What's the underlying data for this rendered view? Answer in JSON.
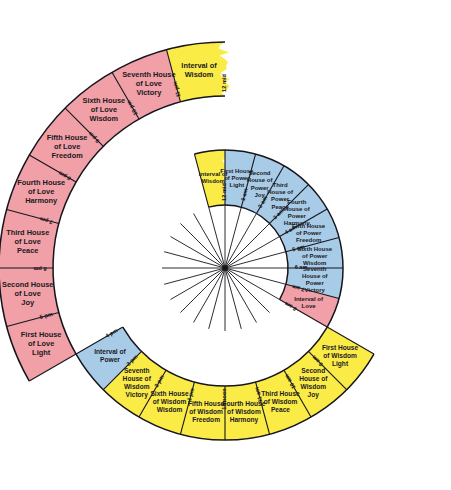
{
  "figure": {
    "name": "spiral-wheel-of-houses",
    "center": {
      "x": 225,
      "y": 268
    },
    "radii": {
      "inner_hole": 63,
      "ring1_outer": 118,
      "ring2_outer": 172,
      "ring3_outer": 226
    },
    "colors": {
      "power_blue": "#A8CBE8",
      "wisdom_yellow": "#FBEB47",
      "love_pink": "#F0A0A6",
      "outline": "#15151c",
      "background": "#ffffff",
      "center_fill": "#ffffff"
    }
  },
  "rings": [
    {
      "name": "inner-ring-power",
      "index": 1,
      "segments": [
        {
          "label": "Interval of\nWisdom",
          "lines": [
            "Interval of",
            "Wisdom"
          ],
          "color": "#FBEB47",
          "start_hour": 23,
          "end_hour": 24,
          "torn": true
        },
        {
          "label": "First House\nof Power\nLight",
          "lines": [
            "First House",
            "of Power",
            "Light"
          ],
          "color": "#A8CBE8",
          "start_hour": 0,
          "end_hour": 1
        },
        {
          "label": "Second\nHouse of\nPower\nJoy",
          "lines": [
            "Second",
            "House of",
            "Power",
            "Joy"
          ],
          "color": "#A8CBE8",
          "start_hour": 1,
          "end_hour": 2
        },
        {
          "label": "Third\nHouse of\nPower\nPeace",
          "lines": [
            "Third",
            "House of",
            "Power",
            "Peace"
          ],
          "color": "#A8CBE8",
          "start_hour": 2,
          "end_hour": 3
        },
        {
          "label": "Fourth\nHouse of\nPower\nHarmony",
          "lines": [
            "Fourth",
            "House of",
            "Power",
            "Harmony"
          ],
          "color": "#A8CBE8",
          "start_hour": 3,
          "end_hour": 4
        },
        {
          "label": "Fifth House\nof Power\nFreedom",
          "lines": [
            "Fifth House",
            "of Power",
            "Freedom"
          ],
          "color": "#A8CBE8",
          "start_hour": 4,
          "end_hour": 5
        },
        {
          "label": "Sixth House\nof Power\nWisdom",
          "lines": [
            "Sixth House",
            "of Power",
            "Wisdom"
          ],
          "color": "#A8CBE8",
          "start_hour": 5,
          "end_hour": 6
        },
        {
          "label": "Seventh\nHouse of\nPower\nVictory",
          "lines": [
            "Seventh",
            "House of",
            "Power",
            "Victory"
          ],
          "color": "#A8CBE8",
          "start_hour": 6,
          "end_hour": 7
        },
        {
          "label": "Interval of\nLove",
          "lines": [
            "Interval of",
            "Love"
          ],
          "color": "#F0A0A6",
          "start_hour": 7,
          "end_hour": 8
        }
      ],
      "time_labels": [
        "12 mid",
        "1 am",
        "2 am",
        "3 am",
        "4 am",
        "5 am",
        "6 am",
        "7 am",
        "8 am"
      ]
    },
    {
      "name": "middle-ring-wisdom",
      "index": 2,
      "segments": [
        {
          "label": "First House\nof Wisdom\nLight",
          "lines": [
            "First House",
            "of Wisdom",
            "Light"
          ],
          "color": "#FBEB47",
          "start_hour": 8,
          "end_hour": 9
        },
        {
          "label": "Second\nHouse of\nWisdom\nJoy",
          "lines": [
            "Second",
            "House of",
            "Wisdom",
            "Joy"
          ],
          "color": "#FBEB47",
          "start_hour": 9,
          "end_hour": 10
        },
        {
          "label": "Third House\nof Wisdom\nPeace",
          "lines": [
            "Third House",
            "of Wisdom",
            "Peace"
          ],
          "color": "#FBEB47",
          "start_hour": 10,
          "end_hour": 11
        },
        {
          "label": "Fourth House\nof Wisdom\nHarmony",
          "lines": [
            "Fourth House",
            "of Wisdom",
            "Harmony"
          ],
          "color": "#FBEB47",
          "start_hour": 11,
          "end_hour": 12
        },
        {
          "label": "Fifth House\nof Wisdom\nFreedom",
          "lines": [
            "Fifth House",
            "of Wisdom",
            "Freedom"
          ],
          "color": "#FBEB47",
          "start_hour": 12,
          "end_hour": 13
        },
        {
          "label": "Sixth House\nof Wisdom\nWisdom",
          "lines": [
            "Sixth House",
            "of Wisdom",
            "Wisdom"
          ],
          "color": "#FBEB47",
          "start_hour": 13,
          "end_hour": 14
        },
        {
          "label": "Seventh\nHouse of\nWisdom\nVictory",
          "lines": [
            "Seventh",
            "House of",
            "Wisdom",
            "Victory"
          ],
          "color": "#FBEB47",
          "start_hour": 14,
          "end_hour": 15
        },
        {
          "label": "Interval of\nPower",
          "lines": [
            "Interval of",
            "Power"
          ],
          "color": "#A8CBE8",
          "start_hour": 15,
          "end_hour": 16
        }
      ],
      "time_labels": [
        "9 am",
        "10 am",
        "11 am",
        "12 noon",
        "1 pm",
        "2 pm",
        "3 pm",
        "4 pm"
      ]
    },
    {
      "name": "outer-ring-love",
      "index": 3,
      "segments": [
        {
          "label": "First House\nof Love\nLight",
          "lines": [
            "First House",
            "of Love",
            "Light"
          ],
          "color": "#F0A0A6",
          "start_hour": 16,
          "end_hour": 17
        },
        {
          "label": "Second House\nof Love\nJoy",
          "lines": [
            "Second House",
            "of Love",
            "Joy"
          ],
          "color": "#F0A0A6",
          "start_hour": 17,
          "end_hour": 18
        },
        {
          "label": "Third House\nof Love\nPeace",
          "lines": [
            "Third House",
            "of Love",
            "Peace"
          ],
          "color": "#F0A0A6",
          "start_hour": 18,
          "end_hour": 19
        },
        {
          "label": "Fourth House\nof Love\nHarmony",
          "lines": [
            "Fourth House",
            "of Love",
            "Harmony"
          ],
          "color": "#F0A0A6",
          "start_hour": 19,
          "end_hour": 20
        },
        {
          "label": "Fifth House\nof Love\nFreedom",
          "lines": [
            "Fifth House",
            "of Love",
            "Freedom"
          ],
          "color": "#F0A0A6",
          "start_hour": 20,
          "end_hour": 21
        },
        {
          "label": "Sixth House\nof Love\nWisdom",
          "lines": [
            "Sixth House",
            "of Love",
            "Wisdom"
          ],
          "color": "#F0A0A6",
          "start_hour": 21,
          "end_hour": 22
        },
        {
          "label": "Seventh House\nof Love\nVictory",
          "lines": [
            "Seventh House",
            "of Love",
            "Victory"
          ],
          "color": "#F0A0A6",
          "start_hour": 22,
          "end_hour": 23
        },
        {
          "label": "Interval of\nWisdom",
          "lines": [
            "Interval of",
            "Wisdom"
          ],
          "color": "#FBEB47",
          "start_hour": 23,
          "end_hour": 24,
          "torn": true
        }
      ],
      "time_labels": [
        "5 pm",
        "6 pm",
        "7 pm",
        "8 pm",
        "9 pm",
        "10 pm",
        "11 pm",
        "12 mid"
      ]
    }
  ],
  "time_marks": {
    "inner": [
      {
        "text": "12 mid",
        "hour": 0
      },
      {
        "text": "1 am",
        "hour": 1
      },
      {
        "text": "2 am",
        "hour": 2
      },
      {
        "text": "3 am",
        "hour": 3
      },
      {
        "text": "4 am",
        "hour": 4
      },
      {
        "text": "5 am",
        "hour": 5
      },
      {
        "text": "6 am",
        "hour": 6
      },
      {
        "text": "7 am",
        "hour": 7
      },
      {
        "text": "8 am",
        "hour": 8
      }
    ],
    "middle": [
      {
        "text": "9 am",
        "hour": 9
      },
      {
        "text": "10 am",
        "hour": 10
      },
      {
        "text": "11 am",
        "hour": 11
      },
      {
        "text": "12 noon",
        "hour": 12
      },
      {
        "text": "1 pm",
        "hour": 13
      },
      {
        "text": "2 pm",
        "hour": 14
      },
      {
        "text": "3 pm",
        "hour": 15
      },
      {
        "text": "4 pm",
        "hour": 16
      }
    ],
    "outer": [
      {
        "text": "5 pm",
        "hour": 17
      },
      {
        "text": "6 pm",
        "hour": 18
      },
      {
        "text": "7 pm",
        "hour": 19
      },
      {
        "text": "8 pm",
        "hour": 20
      },
      {
        "text": "9 pm",
        "hour": 21
      },
      {
        "text": "10 pm",
        "hour": 22
      },
      {
        "text": "11 pm",
        "hour": 23
      },
      {
        "text": "12 mid",
        "hour": 24
      }
    ]
  }
}
